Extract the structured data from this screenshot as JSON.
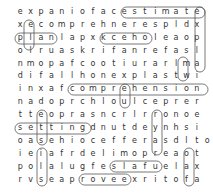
{
  "puzzle": {
    "rows": [
      "expaniofacestimate",
      "xecomprehnerespldx",
      "planlapxkceholeaop",
      "olruaskrifanrefasl",
      "nmopafcootiurarlma",
      "difallhonexplastwi",
      "inxafcomprehension",
      "nadoprchloulceprer",
      "tteoprasncrlrronoe",
      "settingdnutdeynhsi",
      "oasehiocefferasdlto",
      "ieiafrdelimopreaot",
      "polalugfeslafuelax",
      "rvseaproveexritofa"
    ],
    "found_words": [
      "estimate",
      "explain",
      "plan",
      "comprehension",
      "setting",
      "prove",
      "false",
      "check"
    ]
  }
}
